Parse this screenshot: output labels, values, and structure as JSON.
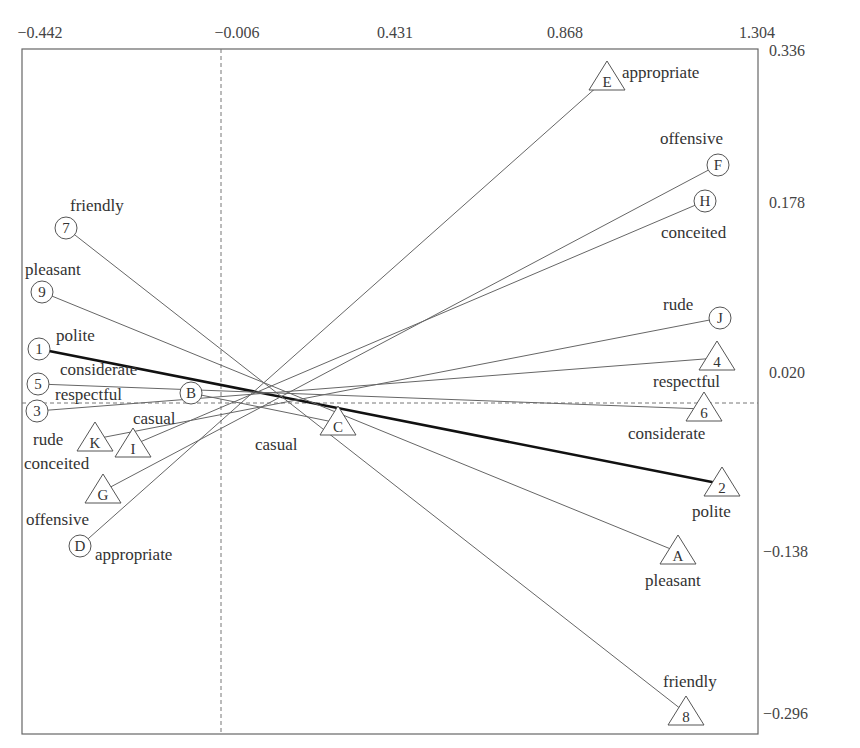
{
  "chart_data": {
    "type": "scatter",
    "title": "",
    "subtitle": "Correspondence/biplot of paired semantic-differential items (circles = one pole, triangles = opposite pole)",
    "x_ticks": [
      "-0.442",
      "-0.006",
      "0.431",
      "0.868",
      "1.304"
    ],
    "y_ticks": [
      "0.336",
      "0.178",
      "0.020",
      "-0.138",
      "-0.296"
    ],
    "xlim": [
      -0.442,
      1.304
    ],
    "ylim": [
      -0.296,
      0.336
    ],
    "grid": false,
    "reference_lines": {
      "x": -0.006,
      "y": 0.0
    },
    "points": [
      {
        "id": "1",
        "shape": "circle",
        "label": "polite",
        "x": 39,
        "y": 349
      },
      {
        "id": "2",
        "shape": "triangle",
        "label": "polite",
        "x": 722,
        "y": 484
      },
      {
        "id": "3",
        "shape": "circle",
        "label": "",
        "x": 37,
        "y": 411
      },
      {
        "id": "4",
        "shape": "triangle",
        "label": "respectful",
        "x": 717,
        "y": 358
      },
      {
        "id": "5",
        "shape": "circle",
        "label": "considerate",
        "x": 38,
        "y": 384
      },
      {
        "id": "6",
        "shape": "triangle",
        "label": "considerate",
        "x": 704,
        "y": 409
      },
      {
        "id": "7",
        "shape": "circle",
        "label": "friendly",
        "x": 66,
        "y": 228
      },
      {
        "id": "8",
        "shape": "triangle",
        "label": "friendly",
        "x": 686,
        "y": 713
      },
      {
        "id": "9",
        "shape": "circle",
        "label": "pleasant",
        "x": 42,
        "y": 292
      },
      {
        "id": "A",
        "shape": "triangle",
        "label": "pleasant",
        "x": 678,
        "y": 552
      },
      {
        "id": "B",
        "shape": "circle",
        "label": "respectful",
        "x": 191,
        "y": 393
      },
      {
        "id": "C",
        "shape": "triangle",
        "label": "casual",
        "x": 338,
        "y": 423
      },
      {
        "id": "D",
        "shape": "circle",
        "label": "appropriate",
        "x": 80,
        "y": 546
      },
      {
        "id": "E",
        "shape": "triangle",
        "label": "appropriate",
        "x": 607,
        "y": 78
      },
      {
        "id": "F",
        "shape": "circle",
        "label": "offensive",
        "x": 718,
        "y": 165
      },
      {
        "id": "G",
        "shape": "triangle",
        "label": "offensive",
        "x": 103,
        "y": 491
      },
      {
        "id": "H",
        "shape": "circle",
        "label": "conceited",
        "x": 705,
        "y": 201
      },
      {
        "id": "I",
        "shape": "triangle",
        "label": "casual",
        "x": 133,
        "y": 445
      },
      {
        "id": "J",
        "shape": "circle",
        "label": "rude",
        "x": 720,
        "y": 318
      },
      {
        "id": "K",
        "shape": "triangle",
        "label": "rude / conceited",
        "x": 95,
        "y": 439
      }
    ],
    "connections": [
      {
        "from": "1",
        "to": "2",
        "bold": true
      },
      {
        "from": "3",
        "to": "4",
        "bold": false
      },
      {
        "from": "5",
        "to": "6",
        "bold": false
      },
      {
        "from": "7",
        "to": "8",
        "bold": false
      },
      {
        "from": "9",
        "to": "A",
        "bold": false
      },
      {
        "from": "B",
        "to": "C",
        "bold": false
      },
      {
        "from": "D",
        "to": "E",
        "bold": false
      },
      {
        "from": "G",
        "to": "F",
        "bold": false
      },
      {
        "from": "I",
        "to": "H",
        "bold": false
      },
      {
        "from": "K",
        "to": "J",
        "bold": false
      }
    ],
    "text_labels": [
      {
        "text": "appropriate",
        "x": 622,
        "y": 78
      },
      {
        "text": "offensive",
        "x": 660,
        "y": 144
      },
      {
        "text": "conceited",
        "x": 661,
        "y": 238
      },
      {
        "text": "rude",
        "x": 663,
        "y": 310
      },
      {
        "text": "respectful",
        "x": 653,
        "y": 387
      },
      {
        "text": "considerate",
        "x": 628,
        "y": 439
      },
      {
        "text": "polite",
        "x": 692,
        "y": 517
      },
      {
        "text": "pleasant",
        "x": 645,
        "y": 586
      },
      {
        "text": "friendly",
        "x": 663,
        "y": 687
      },
      {
        "text": "friendly",
        "x": 70,
        "y": 211
      },
      {
        "text": "pleasant",
        "x": 25,
        "y": 275
      },
      {
        "text": "polite",
        "x": 56,
        "y": 341
      },
      {
        "text": "considerate",
        "x": 60,
        "y": 375
      },
      {
        "text": "respectful",
        "x": 55,
        "y": 400
      },
      {
        "text": "casual",
        "x": 133,
        "y": 424
      },
      {
        "text": "rude",
        "x": 33,
        "y": 445
      },
      {
        "text": "conceited",
        "x": 24,
        "y": 469
      },
      {
        "text": "offensive",
        "x": 26,
        "y": 525
      },
      {
        "text": "appropriate",
        "x": 95,
        "y": 560
      },
      {
        "text": "casual",
        "x": 255,
        "y": 450
      }
    ]
  }
}
